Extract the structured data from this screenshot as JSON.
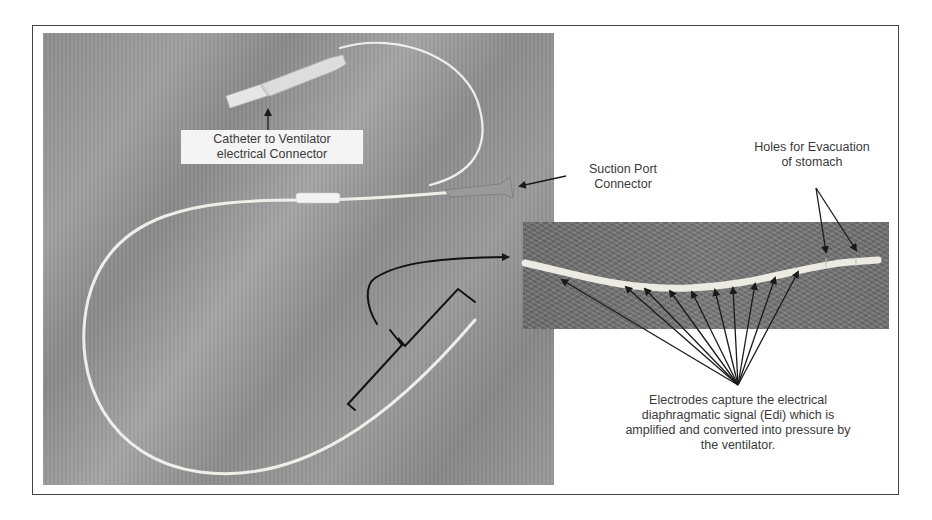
{
  "figure": {
    "labels": {
      "connector": [
        "Catheter to Ventilator",
        "electrical Connector"
      ],
      "suction_port": [
        "Suction Port",
        "Connector"
      ],
      "holes": [
        "Holes for Evacuation",
        "of stomach"
      ],
      "electrodes": [
        "Electrodes capture the electrical",
        "diaphragmatic signal (Edi) which is",
        "amplified and converted into pressure by",
        "the ventilator."
      ]
    },
    "catheter_tag_text": "catheter",
    "colors": {
      "frame_border": "#444444",
      "text": "#3a3a3a",
      "arrow": "#1a1a1a",
      "catheter": "#f0f0ea",
      "fabric": "#959595",
      "inset_fabric": "#757575"
    }
  }
}
